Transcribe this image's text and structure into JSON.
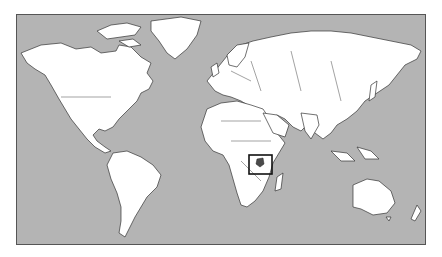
{
  "map": {
    "type": "world-map",
    "projection": "mercator",
    "colors": {
      "ocean": "#b4b4b4",
      "land": "#ffffff",
      "highlight": "#4a4a4a",
      "outline": "#333333"
    },
    "highlighted_region": {
      "name": "Uganda",
      "continent": "Africa"
    },
    "locator_box": {
      "x": 248,
      "y": 154,
      "width": 23,
      "height": 19
    }
  }
}
